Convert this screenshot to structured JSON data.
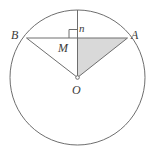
{
  "figure": {
    "kind": "circle-geometry-diagram",
    "background_color": "#ffffff",
    "stroke_color": "#6e6e6e",
    "label_color": "#3b3b3b",
    "shade_color": "#d9d9d9",
    "canvas": {
      "width": 151,
      "height": 150
    }
  },
  "circle": {
    "name": "main-circle",
    "center_x": 77.5,
    "center_y": 77.5,
    "radius": 67.5
  },
  "points": [
    {
      "id": "B",
      "label": "B",
      "x": 26.5,
      "y": 38.0,
      "role": "chord-endpoint-left"
    },
    {
      "id": "A",
      "label": "A",
      "x": 127.5,
      "y": 38.0,
      "role": "chord-endpoint-right"
    },
    {
      "id": "M",
      "label": "M",
      "x": 77.5,
      "y": 38.0,
      "role": "chord-midpoint"
    },
    {
      "id": "O",
      "label": "O",
      "x": 77.5,
      "y": 77.5,
      "role": "circle-center"
    },
    {
      "id": "T",
      "label": "",
      "x": 77.5,
      "y": 10.0,
      "role": "arc-top-point"
    }
  ],
  "segments": [
    {
      "id": "BA",
      "from": "B",
      "to": "A",
      "style": "solid",
      "note": "horizontal chord"
    },
    {
      "id": "BO",
      "from": "B",
      "to": "O",
      "style": "solid",
      "note": "radius to B"
    },
    {
      "id": "AO",
      "from": "A",
      "to": "O",
      "style": "solid",
      "note": "radius to A"
    },
    {
      "id": "TO",
      "from": "T",
      "to": "O",
      "style": "solid",
      "note": "vertical line through midpoint M"
    }
  ],
  "shaded_region": {
    "name": "triangle-MAO",
    "vertices": [
      "M",
      "A",
      "O"
    ],
    "fill": "#d9d9d9"
  },
  "marks": {
    "right_angle": {
      "name": "right-angle-mark-at-M",
      "at_point": "M",
      "size": 8,
      "orientation": "left-of-vertical-above-chord"
    },
    "center_dot": {
      "name": "center-dot-O",
      "at_point": "O",
      "radius": 1.8
    }
  },
  "labels": {
    "B": "B",
    "A": "A",
    "M": "M",
    "O": "O",
    "n": "n"
  },
  "annotation_n": {
    "text": "n",
    "x": 82,
    "y": 28,
    "note": "segment label near top vertical line"
  }
}
